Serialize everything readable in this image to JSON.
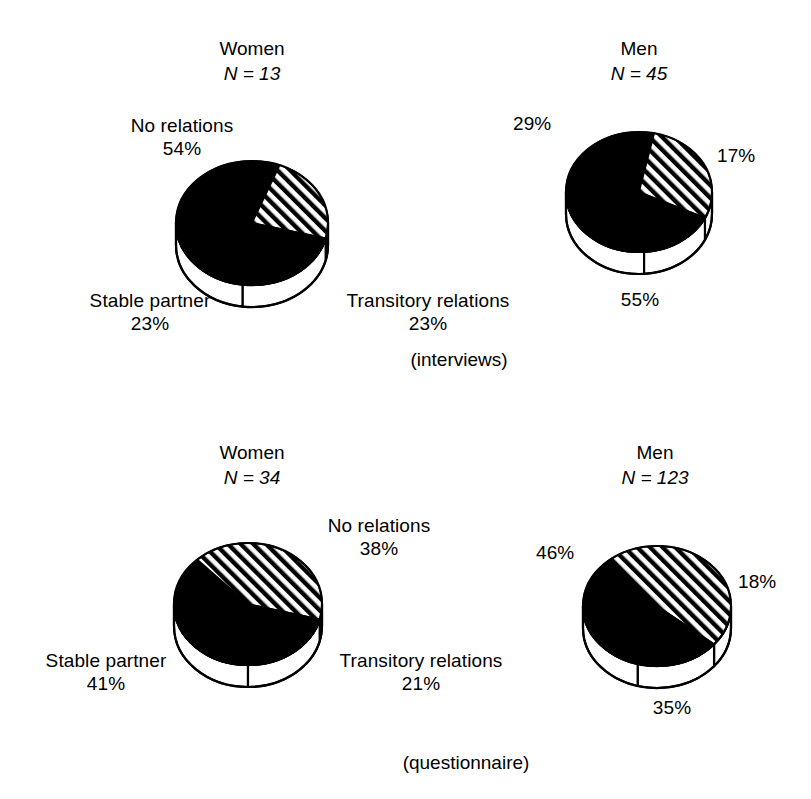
{
  "figure": {
    "panels": [
      {
        "id": "women-interviews",
        "title": "Women",
        "n_label": "N = 13",
        "caption": "",
        "labels": {
          "no_relations": "No relations",
          "no_relations_pct": "54%",
          "stable_partner": "Stable partner",
          "stable_partner_pct": "23%",
          "transitory": "Transitory relations",
          "transitory_pct": "23%"
        }
      },
      {
        "id": "men-interviews",
        "title": "Men",
        "n_label": "N = 45",
        "caption": "(interviews)",
        "labels": {
          "no_relations_pct": "55%",
          "stable_partner_pct": "29%",
          "transitory_pct": "17%"
        }
      },
      {
        "id": "women-questionnaire",
        "title": "Women",
        "n_label": "N = 34",
        "caption": "",
        "labels": {
          "no_relations": "No relations",
          "no_relations_pct": "38%",
          "stable_partner": "Stable partner",
          "stable_partner_pct": "41%",
          "transitory": "Transitory relations",
          "transitory_pct": "21%"
        }
      },
      {
        "id": "men-questionnaire",
        "title": "Men",
        "n_label": "N = 123",
        "caption": "(questionnaire)",
        "labels": {
          "no_relations_pct": "35%",
          "stable_partner_pct": "46%",
          "transitory_pct": "18%"
        }
      }
    ]
  },
  "chart_data": [
    {
      "type": "pie",
      "title": "Women",
      "subtitle": "N = 13",
      "group": "interviews",
      "categories": [
        "No relations",
        "Stable partner",
        "Transitory relations"
      ],
      "values": [
        54,
        23,
        23
      ],
      "labels": [
        "54%",
        "23%",
        "23%"
      ],
      "fills": [
        "black",
        "hatched",
        "black"
      ],
      "legend": "none",
      "grid": false
    },
    {
      "type": "pie",
      "title": "Men",
      "subtitle": "N = 45",
      "group": "interviews",
      "categories": [
        "No relations",
        "Stable partner",
        "Transitory relations"
      ],
      "values": [
        55,
        29,
        17
      ],
      "labels": [
        "55%",
        "29%",
        "17%"
      ],
      "fills": [
        "black",
        "hatched",
        "black"
      ],
      "legend": "none",
      "grid": false
    },
    {
      "type": "pie",
      "title": "Women",
      "subtitle": "N = 34",
      "group": "questionnaire",
      "categories": [
        "No relations",
        "Stable partner",
        "Transitory relations"
      ],
      "values": [
        38,
        41,
        21
      ],
      "labels": [
        "38%",
        "41%",
        "21%"
      ],
      "fills": [
        "black",
        "hatched",
        "black"
      ],
      "legend": "none",
      "grid": false
    },
    {
      "type": "pie",
      "title": "Men",
      "subtitle": "N = 123",
      "group": "questionnaire",
      "categories": [
        "No relations",
        "Stable partner",
        "Transitory relations"
      ],
      "values": [
        35,
        46,
        18
      ],
      "labels": [
        "35%",
        "46%",
        "18%"
      ],
      "fills": [
        "black",
        "hatched",
        "black"
      ],
      "legend": "none",
      "grid": false
    }
  ],
  "colors": {
    "ink": "#000000",
    "paper": "#ffffff"
  }
}
